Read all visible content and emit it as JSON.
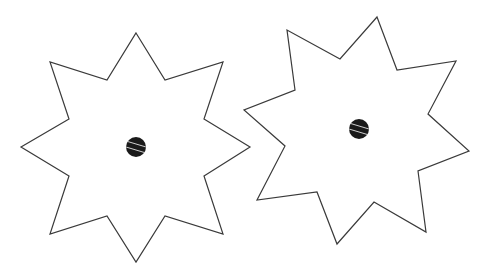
{
  "figure": {
    "stroke_color": "#3a3a3a",
    "fill_color": "#ffffff",
    "dot_color": "#1a1a1a",
    "stripe_color": "#d0d0d0"
  },
  "shapes": [
    {
      "name": "left-star",
      "points": "136,33 165,80 223,62 204,119 250,147 204,176 223,234 165,216 136,262 107,216 50,234 69,176 21,147 69,119 50,62 107,80",
      "center": {
        "x": 136,
        "y": 147,
        "r": 10
      }
    },
    {
      "name": "right-star",
      "points": "377,17 397,70 456,61 428,114 469,151 418,171 426,232 374,202 337,244 317,192 257,200 285,146 244,110 295,90 287,30 340,59",
      "center": {
        "x": 359,
        "y": 129,
        "r": 10
      }
    }
  ]
}
